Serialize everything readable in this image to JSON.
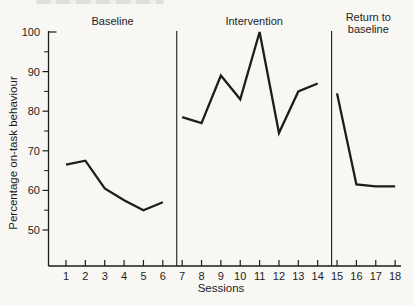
{
  "colors": {
    "ink": "#1d1d1d",
    "background": "#f8f7f4",
    "remnant_gray": "#d7d6d2"
  },
  "chart_data": {
    "type": "line",
    "title": "",
    "xlabel": "Sessions",
    "ylabel": "Percentage on-task behaviour",
    "ylim": [
      41,
      100
    ],
    "y_ticks": [
      50,
      60,
      70,
      80,
      90,
      100
    ],
    "y_minor_ticks": [
      55,
      65,
      75,
      85,
      95
    ],
    "x_ticks": [
      1,
      2,
      3,
      4,
      5,
      6,
      7,
      8,
      9,
      10,
      11,
      12,
      13,
      14,
      15,
      16,
      17,
      18
    ],
    "grid": "off",
    "legend": "none",
    "phases": [
      {
        "name": "Baseline",
        "label_lines": [
          "Baseline"
        ],
        "sessions": [
          1,
          2,
          3,
          4,
          5,
          6
        ],
        "values": [
          66.5,
          67.5,
          60.5,
          57.5,
          55,
          57
        ]
      },
      {
        "name": "Intervention",
        "label_lines": [
          "Intervention"
        ],
        "sessions": [
          7,
          8,
          9,
          10,
          11,
          12,
          13,
          14
        ],
        "values": [
          78.5,
          77,
          89,
          83,
          100,
          74.5,
          85,
          87
        ]
      },
      {
        "name": "Return to baseline",
        "label_lines": [
          "Return to",
          "baseline"
        ],
        "sessions": [
          15,
          16,
          17,
          18
        ],
        "values": [
          84.5,
          61.5,
          61,
          61
        ]
      }
    ]
  }
}
